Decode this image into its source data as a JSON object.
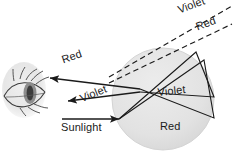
{
  "figure": {
    "canvas": {
      "width": 233,
      "height": 152,
      "background": "#ffffff"
    }
  },
  "colors": {
    "ink": "#1a1a1a",
    "droplet_fill": "#e3e3e3",
    "droplet_edge": "#d2d2d2",
    "eye_blob": "#e8e8e8",
    "eye_iris": "#4a4a4a",
    "background": "#ffffff"
  },
  "labels": {
    "red_beam": "Red",
    "violet_beam": "Violet",
    "sunlight": "Sunlight",
    "violet_dashed": "Violet",
    "red_dashed": "Red",
    "violet_internal": "Violet",
    "red_internal": "Red"
  },
  "elements": {
    "eye": {
      "name": "eye",
      "cx": 24,
      "cy": 90,
      "rx": 22,
      "ry": 28
    },
    "raindrop": {
      "name": "raindrop",
      "cx": 163,
      "cy": 99,
      "r": 51
    },
    "dashed_rays": [
      {
        "name": "violet-sightline",
        "label": "Violet"
      },
      {
        "name": "red-sightline",
        "label": "Red"
      }
    ],
    "solid_rays": [
      {
        "name": "incoming-sunlight",
        "label": "Sunlight"
      },
      {
        "name": "outgoing-red",
        "label": "Red"
      },
      {
        "name": "outgoing-violet",
        "label": "Violet"
      },
      {
        "name": "internal-violet",
        "label": "Violet"
      },
      {
        "name": "internal-red",
        "label": "Red"
      }
    ]
  }
}
